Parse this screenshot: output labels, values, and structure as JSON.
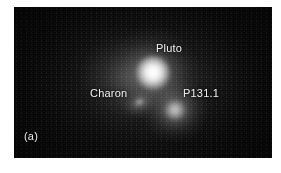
{
  "figure": {
    "panel_letter": "(a)",
    "field_background_color": "#050505",
    "label_color": "#f2f2f2",
    "page_background_color": "#ffffff"
  },
  "objects": [
    {
      "id": "pluto",
      "label": "Pluto",
      "brightness": "brightest",
      "description": "saturated white stellar core with broad halo"
    },
    {
      "id": "charon",
      "label": "Charon",
      "brightness": "faintest",
      "description": "small elongated smudge left of centre"
    },
    {
      "id": "p1311",
      "label": "P131.1",
      "brightness": "intermediate",
      "description": "diffuse round blob lower right of Pluto"
    }
  ],
  "labels": {
    "pluto": "Pluto",
    "charon": "Charon",
    "p1311": "P131.1"
  }
}
